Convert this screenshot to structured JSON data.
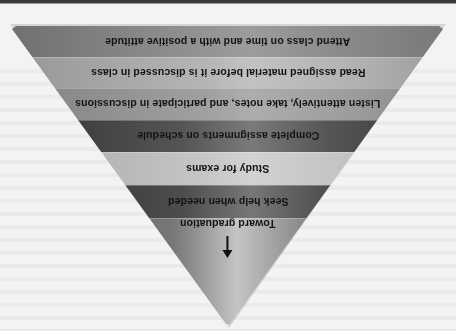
{
  "figure": {
    "orientation": "rotated-180",
    "title": "",
    "tiers": [
      {
        "label": "Attend class on time and with a positive attitude",
        "color": "#8a8a8a"
      },
      {
        "label": "Read assigned material before it is discussed in class",
        "color": "#b0b0b0"
      },
      {
        "label": "Listen attentively, take notes, and participate in discussions",
        "color": "#9a9a9a"
      },
      {
        "label": "Complete assignments on schedule",
        "color": "#555555"
      },
      {
        "label": "Study for exams",
        "color": "#c0c0c0"
      },
      {
        "label": "Seek help when needed",
        "color": "#4d4d4d"
      },
      {
        "label": "Toward graduation",
        "color": "#8a8a8a"
      }
    ],
    "arrow": "arrow-toward-tip"
  }
}
